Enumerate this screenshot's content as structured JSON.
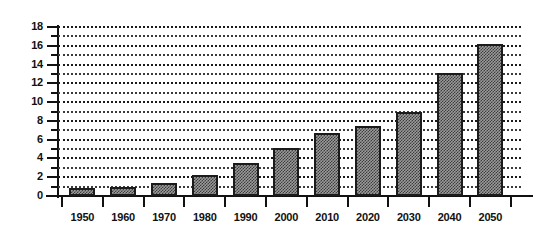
{
  "chart_data": {
    "type": "bar",
    "title": "",
    "subtitle": "",
    "xlabel": "",
    "ylabel": "",
    "categories": [
      "1950",
      "1960",
      "1970",
      "1980",
      "1990",
      "2000",
      "2010",
      "2020",
      "2030",
      "2040",
      "2050"
    ],
    "values": [
      0.9,
      1.0,
      1.4,
      2.2,
      3.5,
      5.1,
      6.7,
      7.5,
      8.9,
      13.1,
      16.2
    ],
    "ylim": [
      0,
      18
    ],
    "ytick_values": [
      0,
      2,
      4,
      6,
      8,
      10,
      12,
      14,
      16,
      18
    ],
    "ytick_labels": [
      "0",
      "2",
      "4",
      "6",
      "8",
      "10",
      "12",
      "14",
      "16",
      "18"
    ],
    "yminor_values": [
      1,
      3,
      5,
      7,
      9,
      11,
      13,
      15,
      17
    ],
    "gridlines": "horizontal-dotted-major-and-minor",
    "legend": "none",
    "legend_position": "none",
    "bar_fill": "#9a9a9a",
    "bar_pattern": "checkerboard-dither",
    "bar_border": "#1b1b1b",
    "axis_color": "#111111",
    "background": "#ffffff"
  },
  "axes": {
    "y_tick_labels": [
      "18",
      "16",
      "14",
      "12",
      "10",
      "8",
      "6",
      "4",
      "2",
      "0"
    ],
    "x_tick_labels": [
      "1950",
      "1960",
      "1970",
      "1980",
      "1990",
      "2000",
      "2010",
      "2020",
      "2030",
      "2040",
      "2050"
    ]
  }
}
